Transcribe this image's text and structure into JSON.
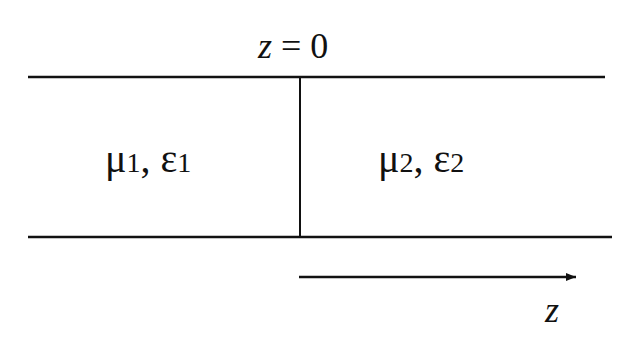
{
  "diagram": {
    "type": "interface-between-two-media",
    "interface_label": "z = 0",
    "interface_label_var": "z",
    "interface_label_rest": " = 0",
    "region_left": {
      "mu": "μ",
      "mu_sub": "1",
      "sep": ", ",
      "eps": "ε",
      "eps_sub": "1"
    },
    "region_right": {
      "mu": "μ",
      "mu_sub": "2",
      "sep": ", ",
      "eps": "ε",
      "eps_sub": "2"
    },
    "axis_label": "z",
    "colors": {
      "line": "#111111",
      "background": "#ffffff"
    }
  }
}
